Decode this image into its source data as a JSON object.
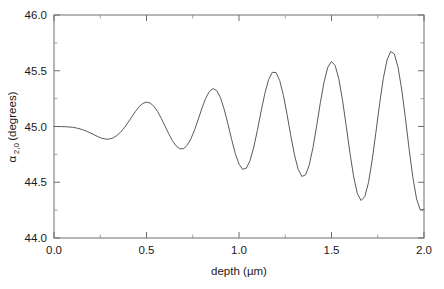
{
  "chart_data": {
    "type": "line",
    "title": "",
    "xlabel": "depth (µm)",
    "ylabel": "α 2,0 (degrees)",
    "ylabel_symbol": "α",
    "ylabel_subscript": "2,0",
    "ylabel_unit": "(degrees)",
    "xlim": [
      0.0,
      2.0
    ],
    "ylim": [
      44.0,
      46.0
    ],
    "xticks": [
      0.0,
      0.5,
      1.0,
      1.5,
      2.0
    ],
    "xtick_labels": [
      "0.0",
      "0.5",
      "1.0",
      "1.5",
      "2.0"
    ],
    "yticks": [
      44.0,
      44.5,
      45.0,
      45.5,
      46.0
    ],
    "ytick_labels": [
      "44.0",
      "44.5",
      "45.0",
      "45.5",
      "46.0"
    ],
    "xminor_ticks": [
      0.25,
      0.75,
      1.25,
      1.75
    ],
    "yminor_ticks": [
      44.25,
      44.75,
      45.25,
      45.75
    ],
    "grid": false,
    "legend": null,
    "line_color": "#5a5a5a",
    "frame_color": "#6e6e6e",
    "background": "#ffffff",
    "peaks": [
      {
        "x": 0.37,
        "y": 45.19
      },
      {
        "x": 0.68,
        "y": 45.28
      },
      {
        "x": 1.0,
        "y": 45.37
      },
      {
        "x": 1.32,
        "y": 45.46
      },
      {
        "x": 1.63,
        "y": 45.51
      },
      {
        "x": 1.95,
        "y": 45.55
      }
    ],
    "troughs": [
      {
        "x": 0.25,
        "y": 44.89
      },
      {
        "x": 0.52,
        "y": 44.82
      },
      {
        "x": 0.84,
        "y": 44.73
      },
      {
        "x": 1.16,
        "y": 44.63
      },
      {
        "x": 1.47,
        "y": 44.55
      },
      {
        "x": 1.78,
        "y": 44.48
      }
    ],
    "x": [
      0.0,
      0.02,
      0.04,
      0.06,
      0.08,
      0.1,
      0.12,
      0.14,
      0.16,
      0.18,
      0.2,
      0.22,
      0.24,
      0.26,
      0.28,
      0.3,
      0.32,
      0.34,
      0.36,
      0.38,
      0.4,
      0.42,
      0.44,
      0.46,
      0.48,
      0.5,
      0.52,
      0.54,
      0.56,
      0.58,
      0.6,
      0.62,
      0.64,
      0.66,
      0.68,
      0.7,
      0.72,
      0.74,
      0.76,
      0.78,
      0.8,
      0.82,
      0.84,
      0.86,
      0.88,
      0.9,
      0.92,
      0.94,
      0.96,
      0.98,
      1.0,
      1.02,
      1.04,
      1.06,
      1.08,
      1.1,
      1.12,
      1.14,
      1.16,
      1.18,
      1.2,
      1.22,
      1.24,
      1.26,
      1.28,
      1.3,
      1.32,
      1.34,
      1.36,
      1.38,
      1.4,
      1.42,
      1.44,
      1.46,
      1.48,
      1.5,
      1.52,
      1.54,
      1.56,
      1.58,
      1.6,
      1.62,
      1.64,
      1.66,
      1.68,
      1.7,
      1.72,
      1.74,
      1.76,
      1.78,
      1.8,
      1.82,
      1.84,
      1.86,
      1.88,
      1.9,
      1.92,
      1.94,
      1.96,
      1.98,
      2.0
    ],
    "y": [
      45.0,
      45.0,
      44.999,
      44.998,
      44.996,
      44.993,
      44.987,
      44.979,
      44.968,
      44.955,
      44.94,
      44.923,
      44.907,
      44.894,
      44.887,
      44.888,
      44.898,
      44.919,
      44.95,
      44.989,
      45.036,
      45.086,
      45.135,
      45.178,
      45.207,
      45.219,
      45.21,
      45.181,
      45.134,
      45.073,
      45.004,
      44.935,
      44.873,
      44.826,
      44.8,
      44.801,
      44.831,
      44.889,
      44.97,
      45.066,
      45.165,
      45.253,
      45.315,
      45.34,
      45.321,
      45.257,
      45.154,
      45.024,
      44.885,
      44.758,
      44.663,
      44.616,
      44.627,
      44.696,
      44.816,
      44.971,
      45.14,
      45.298,
      45.42,
      45.486,
      45.484,
      45.412,
      45.28,
      45.106,
      44.917,
      44.744,
      44.615,
      44.552,
      44.566,
      44.657,
      44.812,
      45.008,
      45.216,
      45.401,
      45.531,
      45.583,
      45.546,
      45.424,
      45.232,
      44.999,
      44.758,
      44.547,
      44.398,
      44.336,
      44.371,
      44.498,
      44.7,
      44.947,
      45.203,
      45.431,
      45.596,
      45.673,
      45.65,
      45.529,
      45.326,
      45.068,
      44.793,
      44.541,
      44.35,
      44.25,
      44.258
    ]
  },
  "axis": {
    "y_title_symbol": "α",
    "y_title_sub": "2,0",
    "y_title_rest": " (degrees)",
    "x_title": "depth (µm)"
  }
}
